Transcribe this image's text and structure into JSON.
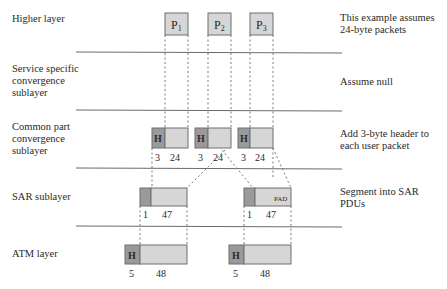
{
  "layers": [
    {
      "label": "Higher layer",
      "note": "This example assumes\n24-byte packets"
    },
    {
      "label": "Service specific\nconvergence\nsublayer",
      "note": "Assume null"
    },
    {
      "label": "Common part\nconvergence\nsublayer",
      "note": "Add 3-byte header to\neach user packet"
    },
    {
      "label": "SAR sublayer",
      "note": "Segment into SAR\nPDUs"
    },
    {
      "label": "ATM layer",
      "note": ""
    }
  ],
  "packets": [
    {
      "name": "P",
      "sub": "1"
    },
    {
      "name": "P",
      "sub": "2"
    },
    {
      "name": "P",
      "sub": "3"
    }
  ],
  "cpcs": {
    "header_label": "H",
    "header_size": "3",
    "payload_size": "24"
  },
  "sar": {
    "header_size": "1",
    "payload_size": "47",
    "pad_label": "PAD"
  },
  "atm": {
    "header_label": "H",
    "header_size": "5",
    "payload_size": "48"
  },
  "colors": {
    "header_fill": "#9a9a9a",
    "payload_fill": "#d6d6d6",
    "border": "#6f6f6f",
    "line": "#6a6a6a"
  }
}
